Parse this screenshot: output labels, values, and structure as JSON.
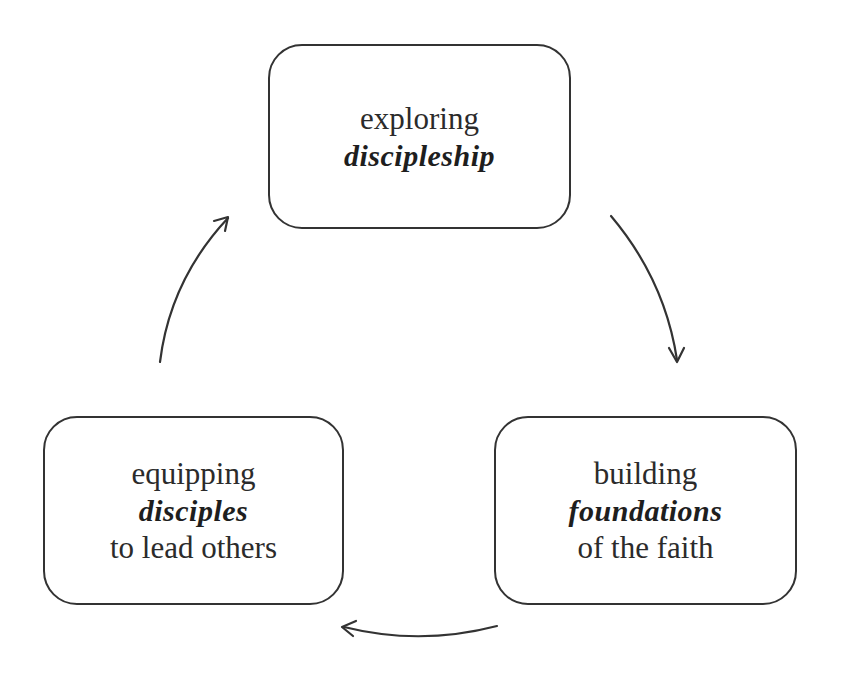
{
  "diagram": {
    "type": "cycle",
    "nodes": [
      {
        "id": "top",
        "line1": "exploring",
        "script": "discipleship",
        "line3": ""
      },
      {
        "id": "right",
        "line1": "building",
        "script": "foundations",
        "line3": "of the faith"
      },
      {
        "id": "left",
        "line1": "equipping",
        "script": "disciples",
        "line3": "to lead others"
      }
    ],
    "edges": [
      {
        "from": "top",
        "to": "right"
      },
      {
        "from": "right",
        "to": "left"
      },
      {
        "from": "left",
        "to": "top"
      }
    ],
    "colors": {
      "stroke": "#333333",
      "text": "#2b2b2b",
      "background": "#ffffff"
    }
  }
}
